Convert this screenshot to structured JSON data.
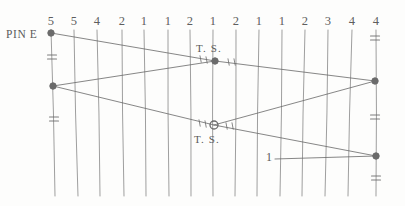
{
  "diagram": {
    "ink_color": "#6b6b6b",
    "text_color": "#5a5a5a",
    "background_color": "#fdfdfc",
    "labels": {
      "pin_e": "PIN E",
      "ts_upper": "T. S.",
      "ts_lower": "T. S.",
      "callout_one": "1"
    },
    "column_numbers": [
      {
        "value": "5",
        "x": 51
      },
      {
        "value": "5",
        "x": 74
      },
      {
        "value": "4",
        "x": 97
      },
      {
        "value": "2",
        "x": 122
      },
      {
        "value": "1",
        "x": 144
      },
      {
        "value": "1",
        "x": 168
      },
      {
        "value": "2",
        "x": 190
      },
      {
        "value": "1",
        "x": 213
      },
      {
        "value": "2",
        "x": 236
      },
      {
        "value": "1",
        "x": 259
      },
      {
        "value": "1",
        "x": 282
      },
      {
        "value": "2",
        "x": 305
      },
      {
        "value": "3",
        "x": 328
      },
      {
        "value": "4",
        "x": 352
      },
      {
        "value": "4",
        "x": 376
      }
    ],
    "vertical_lines": [
      {
        "x_top": 51,
        "x_bottom": 55
      },
      {
        "x_top": 74,
        "x_bottom": 78
      },
      {
        "x_top": 97,
        "x_bottom": 100
      },
      {
        "x_top": 122,
        "x_bottom": 124
      },
      {
        "x_top": 144,
        "x_bottom": 146
      },
      {
        "x_top": 168,
        "x_bottom": 169
      },
      {
        "x_top": 190,
        "x_bottom": 191
      },
      {
        "x_top": 213,
        "x_bottom": 213
      },
      {
        "x_top": 236,
        "x_bottom": 235
      },
      {
        "x_top": 259,
        "x_bottom": 257
      },
      {
        "x_top": 282,
        "x_bottom": 280
      },
      {
        "x_top": 305,
        "x_bottom": 302
      },
      {
        "x_top": 328,
        "x_bottom": 325
      },
      {
        "x_top": 352,
        "x_bottom": 348
      },
      {
        "x_top": 376,
        "x_bottom": 376
      }
    ],
    "nodes": [
      {
        "name": "pin-e-node",
        "x": 51,
        "y": 33,
        "style": "filled"
      },
      {
        "name": "left-mid-node",
        "x": 53,
        "y": 86,
        "style": "filled"
      },
      {
        "name": "ts-upper-node",
        "x": 215,
        "y": 61,
        "style": "filled"
      },
      {
        "name": "ts-lower-node",
        "x": 214,
        "y": 125,
        "style": "open"
      },
      {
        "name": "right-upper-node",
        "x": 375,
        "y": 81,
        "style": "filled"
      },
      {
        "name": "right-lower-node",
        "x": 376,
        "y": 156,
        "style": "filled"
      }
    ],
    "traverse_lines": [
      {
        "name": "pin-e-to-ts-upper",
        "x1": 51,
        "y1": 33,
        "x2": 215,
        "y2": 61
      },
      {
        "name": "left-mid-to-ts-upper",
        "x1": 53,
        "y1": 86,
        "x2": 215,
        "y2": 61
      },
      {
        "name": "left-mid-to-ts-lower",
        "x1": 53,
        "y1": 86,
        "x2": 214,
        "y2": 125
      },
      {
        "name": "ts-upper-to-right-upper",
        "x1": 215,
        "y1": 61,
        "x2": 375,
        "y2": 81
      },
      {
        "name": "ts-lower-to-right-upper",
        "x1": 214,
        "y1": 125,
        "x2": 375,
        "y2": 81
      },
      {
        "name": "ts-lower-to-right-lower",
        "x1": 214,
        "y1": 125,
        "x2": 376,
        "y2": 156
      },
      {
        "name": "callout-leader",
        "x1": 275,
        "y1": 159,
        "x2": 376,
        "y2": 156
      }
    ],
    "tick_marks": [
      {
        "x": 52,
        "y": 55
      },
      {
        "x": 52,
        "y": 59
      },
      {
        "x": 54,
        "y": 117
      },
      {
        "x": 54,
        "y": 121
      },
      {
        "x": 375,
        "y": 36
      },
      {
        "x": 375,
        "y": 40
      },
      {
        "x": 375,
        "y": 115
      },
      {
        "x": 375,
        "y": 119
      },
      {
        "x": 376,
        "y": 176
      },
      {
        "x": 376,
        "y": 180
      }
    ]
  }
}
